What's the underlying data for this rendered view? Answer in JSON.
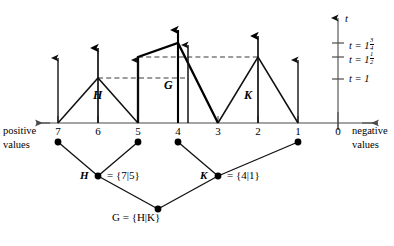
{
  "figure": {
    "caption_type": "combinatorial-game-tent-diagram",
    "axis": {
      "name_left": "positive\nvalues",
      "positive_values_line1": "positive",
      "positive_values_line2": "values",
      "negative_values_line1": "negative",
      "negative_values_line2": "values",
      "tick_labels": [
        "7",
        "6",
        "5",
        "4",
        "3",
        "2",
        "1",
        "0"
      ],
      "tick_x": [
        58,
        98,
        138,
        178,
        218,
        258,
        298,
        338
      ],
      "baseline_y": 123,
      "direction_left_arrow": true,
      "direction_right_arrow": true
    },
    "t_axis": {
      "label": "t",
      "x": 338,
      "top_y": 16,
      "ticks": [
        {
          "label_prefix": "t = 1",
          "whole": "1",
          "num": "3",
          "den": "4",
          "y": 43
        },
        {
          "label_prefix": "t = 1",
          "whole": "1",
          "num": "1",
          "den": "2",
          "y": 57
        },
        {
          "label_prefix": "t = 1",
          "whole": "1",
          "num": "",
          "den": "",
          "y": 79
        }
      ]
    },
    "tents": [
      {
        "name": "H",
        "label": "H",
        "left_x": 58,
        "peak_x": 98,
        "right_x": 138,
        "peak_y": 78,
        "bold": false,
        "label_x": 96,
        "label_y": 96
      },
      {
        "name": "G",
        "label": "G",
        "left_x": 138,
        "peak_x": 178,
        "right_x": 218,
        "peak_y": 43,
        "bold": true,
        "label_x": 168,
        "label_y": 85
      },
      {
        "name": "K",
        "label": "K",
        "left_x": 218,
        "peak_x": 258,
        "right_x": 298,
        "peak_y": 57,
        "bold": false,
        "label_x": 248,
        "label_y": 96
      }
    ],
    "up_arrows": [
      {
        "x": 58,
        "top_y": 55
      },
      {
        "x": 98,
        "top_y": 45
      },
      {
        "x": 138,
        "top_y": 57
      },
      {
        "x": 178,
        "top_y": 27
      },
      {
        "x": 188,
        "top_y": 42
      },
      {
        "x": 258,
        "top_y": 33
      },
      {
        "x": 298,
        "top_y": 57
      }
    ],
    "dashed_lines": [
      {
        "x1": 98,
        "y1": 78,
        "x2": 188,
        "y2": 78
      },
      {
        "x1": 138,
        "y1": 57,
        "x2": 258,
        "y2": 57
      }
    ],
    "tree": {
      "leaves": [
        {
          "label": "7",
          "x": 58,
          "y": 142
        },
        {
          "label": "5",
          "x": 138,
          "y": 142
        },
        {
          "label": "4",
          "x": 178,
          "y": 142
        },
        {
          "label": "1",
          "x": 298,
          "y": 142
        }
      ],
      "nodes": [
        {
          "name": "H",
          "label": "H",
          "equation": "= {7|5}",
          "x": 98,
          "y": 176,
          "label_x": 82,
          "label_y": 170,
          "eq_x": 108,
          "eq_y": 170
        },
        {
          "name": "K",
          "label": "K",
          "equation": "= {4|1}",
          "x": 218,
          "y": 176,
          "label_x": 202,
          "label_y": 170,
          "eq_x": 228,
          "eq_y": 170
        }
      ],
      "root": {
        "name": "G",
        "label": "G = {H|K}",
        "x": 158,
        "y": 209,
        "label_x": 112,
        "label_y": 213
      }
    },
    "colors": {
      "ink": "#000000",
      "axis": "#4a4a4a",
      "dash": "#3a3a3a",
      "background": "#ffffff"
    }
  }
}
